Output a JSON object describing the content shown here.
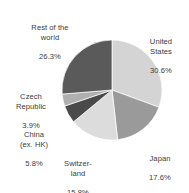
{
  "chart_data": {
    "type": "pie",
    "title": "",
    "subtitle": "",
    "xlabel": "",
    "ylabel": "",
    "legend": "none",
    "grid": false,
    "units": "percent",
    "start_angle_deg": 0,
    "direction": "clockwise",
    "total": 100.0,
    "categories": [
      "United States",
      "Japan",
      "Switzerland",
      "China (ex. HK)",
      "Czech Republic",
      "Rest of the world"
    ],
    "values": [
      30.6,
      17.6,
      15.8,
      5.8,
      3.9,
      26.3
    ],
    "colors": [
      "#d4d4d4",
      "#9a9a9a",
      "#dcdcdc",
      "#4a4a4a",
      "#b0b0b0",
      "#5a5a5a"
    ],
    "slices": [
      {
        "name": "United States",
        "label_lines": "United\nStates",
        "value": 30.6,
        "value_label": "30.6%",
        "color": "#d4d4d4"
      },
      {
        "name": "Japan",
        "label_lines": "Japan",
        "value": 17.6,
        "value_label": "17.6%",
        "color": "#9a9a9a"
      },
      {
        "name": "Switzerland",
        "label_lines": "Switzer-\nland",
        "value": 15.8,
        "value_label": "15.8%",
        "color": "#dcdcdc"
      },
      {
        "name": "China (ex. HK)",
        "label_lines": "China\n(ex. HK)",
        "value": 5.8,
        "value_label": "5.8%",
        "color": "#4a4a4a"
      },
      {
        "name": "Czech Republic",
        "label_lines": "Czech\nRepublic",
        "value": 3.9,
        "value_label": "3.9%",
        "color": "#b0b0b0"
      },
      {
        "name": "Rest of the world",
        "label_lines": "Rest of the\nworld",
        "value": 26.3,
        "value_label": "26.3%",
        "color": "#5a5a5a"
      }
    ]
  },
  "labels": {
    "united_states": {
      "name": "United\nStates",
      "value": "30.6%"
    },
    "japan": {
      "name": "Japan",
      "value": "17.6%"
    },
    "switzerland": {
      "name": "Switzer-\nland",
      "value": "15.8%"
    },
    "china": {
      "name": "China\n(ex. HK)",
      "value": "5.8%"
    },
    "czech": {
      "name": "Czech\nRepublic",
      "value": "3.9%"
    },
    "rest": {
      "name": "Rest of the\nworld",
      "value": "26.3%"
    }
  }
}
